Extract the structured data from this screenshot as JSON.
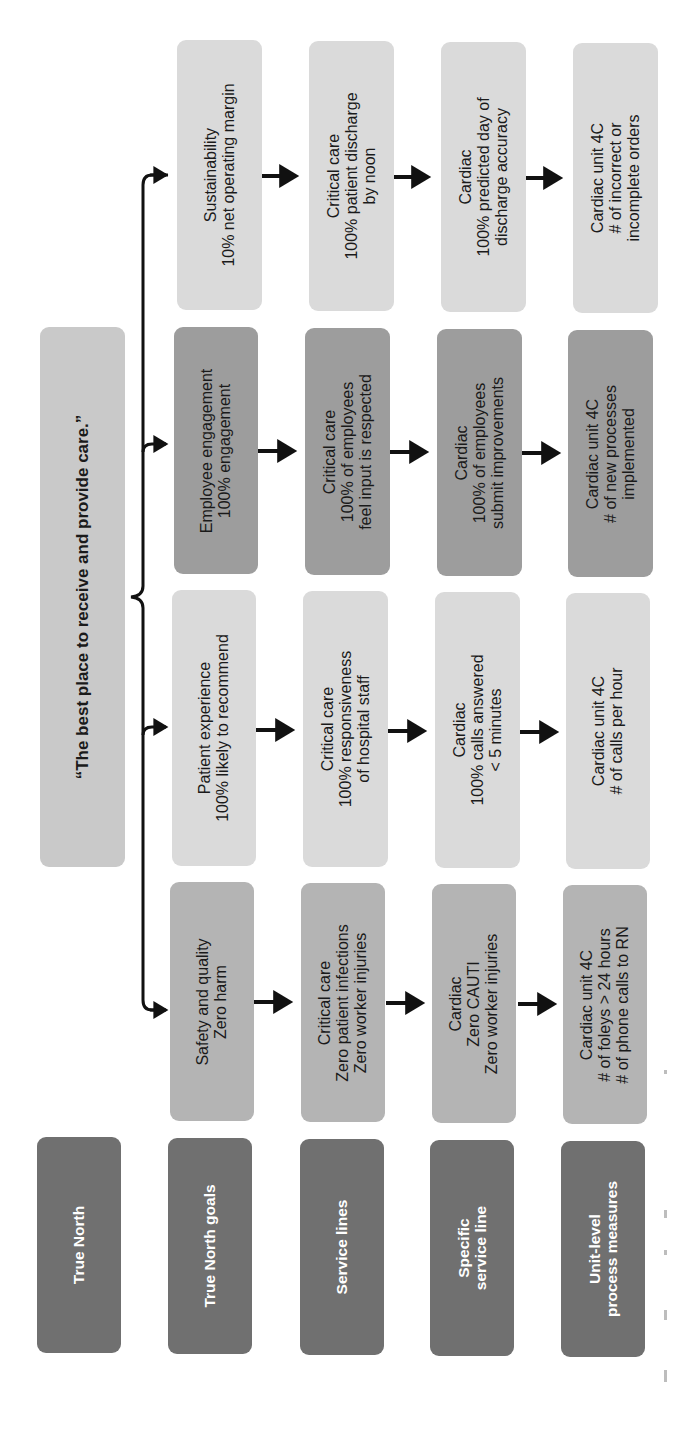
{
  "true_north": {
    "statement": "“The best place to receive and provide care.”"
  },
  "row_labels": [
    {
      "lines": [
        "True North"
      ]
    },
    {
      "lines": [
        "True North goals"
      ]
    },
    {
      "lines": [
        "Service lines"
      ]
    },
    {
      "lines": [
        "Specific",
        "service line"
      ]
    },
    {
      "lines": [
        "Unit-level",
        "process measures"
      ]
    }
  ],
  "goals": [
    {
      "name": "safety",
      "color": "#b4b4b4",
      "levels": [
        {
          "lines": [
            "Safety and quality",
            "Zero harm"
          ]
        },
        {
          "lines": [
            "Critical care",
            "Zero patient infections",
            "Zero worker injuries"
          ]
        },
        {
          "lines": [
            "Cardiac",
            "Zero CAUTI",
            "Zero worker injuries"
          ]
        },
        {
          "lines": [
            "Cardiac unit 4C",
            "# of foleys > 24 hours",
            "# of phone calls to RN"
          ]
        }
      ]
    },
    {
      "name": "patient-experience",
      "color": "#dadada",
      "levels": [
        {
          "lines": [
            "Patient experience",
            "100% likely to recommend"
          ]
        },
        {
          "lines": [
            "Critical care",
            "100% responsiveness",
            "of hospital staff"
          ]
        },
        {
          "lines": [
            "Cardiac",
            "100% calls answered",
            "< 5 minutes"
          ]
        },
        {
          "lines": [
            "Cardiac unit 4C",
            "# of calls per hour"
          ]
        }
      ]
    },
    {
      "name": "employee-engagement",
      "color": "#9d9d9d",
      "levels": [
        {
          "lines": [
            "Employee engagement",
            "100% engagement"
          ]
        },
        {
          "lines": [
            "Critical care",
            "100% of employees",
            "feel input is respected"
          ]
        },
        {
          "lines": [
            "Cardiac",
            "100% of employees",
            "submit improvements"
          ]
        },
        {
          "lines": [
            "Cardiac unit 4C",
            "# of new processes",
            "implemented"
          ]
        }
      ]
    },
    {
      "name": "sustainability",
      "color": "#dadada",
      "levels": [
        {
          "lines": [
            "Sustainability",
            "10% net operating margin"
          ]
        },
        {
          "lines": [
            "Critical care",
            "100% patient discharge",
            "by noon"
          ]
        },
        {
          "lines": [
            "Cardiac",
            "100% predicted day of",
            "discharge accuracy"
          ]
        },
        {
          "lines": [
            "Cardiac unit 4C",
            "# of incorrect or",
            "incomplete orders"
          ]
        }
      ]
    }
  ],
  "colors": {
    "label_box": "#707070",
    "statement_box": "#c9c9c9",
    "arrow": "#111111"
  }
}
